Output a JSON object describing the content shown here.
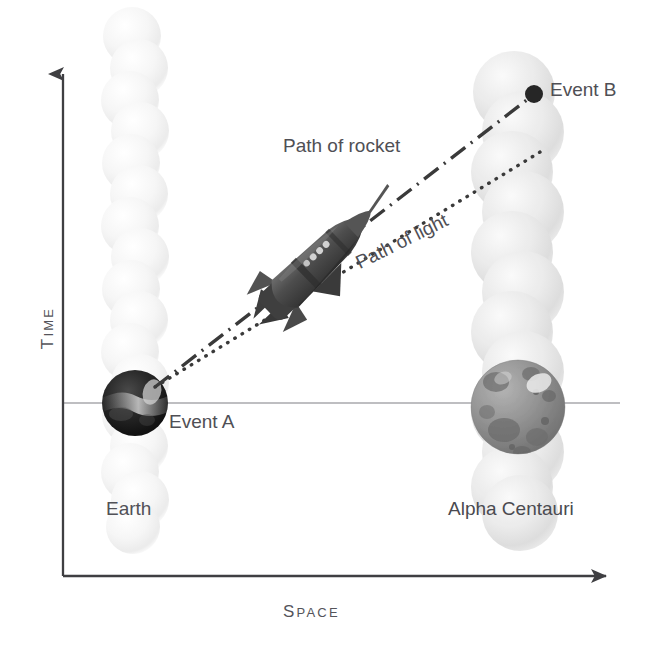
{
  "figure": {
    "kind": "spacetime-diagram",
    "background_color": "#ffffff",
    "ink_color": "#4a4a4f"
  },
  "axes": {
    "time_label": "TIME",
    "time_label_cap": "T",
    "time_label_rest": "IME",
    "space_label": "SPACE",
    "space_label_cap": "S",
    "space_label_rest": "PACE",
    "axis_color": "#555558",
    "origin": {
      "x": 63,
      "y": 576
    },
    "time_axis_top": {
      "x": 63,
      "y": 60
    },
    "space_axis_right": {
      "x": 622,
      "y": 576
    },
    "simultaneity_line": {
      "label": "",
      "color": "#a9a9ad",
      "y": 403,
      "x_start": 62,
      "x_end": 620
    }
  },
  "labels": {
    "path_of_rocket": "Path of rocket",
    "path_of_light": "Path of light",
    "event_a": "Event A",
    "event_b": "Event B",
    "earth": "Earth",
    "alpha_centauri": "Alpha Centauri"
  },
  "worldlines": [
    {
      "name": "earth-worldline",
      "body_label": "Earth",
      "center_x": 135,
      "top_y": 22,
      "bottom_y": 545,
      "bead_radius": 29,
      "bead_color": "#f2f2f2",
      "bead_count": 17
    },
    {
      "name": "alpha-centauri-worldline",
      "body_label": "Alpha Centauri",
      "center_x": 518,
      "top_y": 70,
      "bottom_y": 530,
      "bead_radius": 42,
      "bead_color": "#e2e2e2",
      "bead_count": 12
    }
  ],
  "bodies": [
    {
      "name": "earth-sphere",
      "label": "Earth",
      "cx": 135,
      "cy": 403,
      "r": 33,
      "base_color": "#232323",
      "highlight_color": "#cfcfcf"
    },
    {
      "name": "alpha-centauri-sphere",
      "label": "Alpha Centauri",
      "cx": 518,
      "cy": 407,
      "r": 47,
      "base_color": "#8d8d8d",
      "highlight_color": "#f0f0f0",
      "crater_color": "#6e6e6e"
    }
  ],
  "events": [
    {
      "name": "event-a",
      "label": "Event A",
      "x": 155,
      "y": 387,
      "marker": "none"
    },
    {
      "name": "event-b",
      "label": "Event B",
      "x": 534,
      "y": 94,
      "marker": "filled-dot",
      "marker_radius": 9,
      "marker_color": "#262626"
    }
  ],
  "trajectories": [
    {
      "name": "path-of-rocket",
      "label": "Path of rocket",
      "style": "dash-dot",
      "color": "#3a3a3a",
      "width": 3.2,
      "from": {
        "x": 155,
        "y": 387
      },
      "to": {
        "x": 530,
        "y": 98
      }
    },
    {
      "name": "path-of-light",
      "label": "Path of light",
      "style": "dotted",
      "color": "#3a3a3a",
      "width": 3.2,
      "from": {
        "x": 155,
        "y": 387
      },
      "to": {
        "x": 545,
        "y": 149
      }
    }
  ],
  "rocket": {
    "name": "rocket-icon",
    "tip": {
      "x": 378,
      "y": 210
    },
    "tail": {
      "x": 258,
      "y": 313
    },
    "angle_deg": -44,
    "body_color": "#4a4a4a",
    "fin_color": "#3b3b3b",
    "window_color": "#d9d9d9"
  }
}
